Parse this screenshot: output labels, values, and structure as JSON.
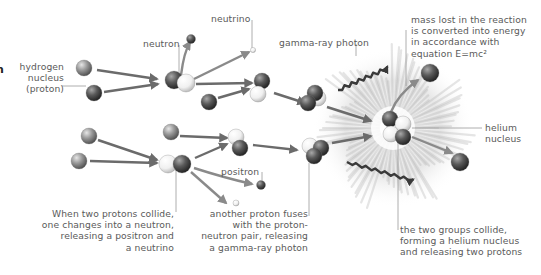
{
  "diagram": {
    "title_fragment": "n",
    "labels": {
      "hydrogen_nucleus": "hydrogen\nnucleus\n(proton)",
      "neutron": "neutron",
      "neutrino": "neutrino",
      "gamma_ray_photon": "gamma-ray photon",
      "mass_lost": "mass lost in the reaction\nis converted into energy\nin accordance with\nequation E=mc²",
      "helium_nucleus": "helium\nnucleus",
      "positron": "positron",
      "step1": "When two protons collide,\none changes into a neutron,\nreleasing a positron and\na neutrino",
      "step2": "another proton fuses\nwith the proton-\nneutron pair, releasing\na gamma-ray photon",
      "step3": "the two groups collide,\nforming a helium nucleus\nand releasing two protons"
    },
    "particle_types": {
      "proton": {
        "name": "proton",
        "color": "#8a8a8a"
      },
      "neutron": {
        "name": "neutron",
        "color": "#555555"
      },
      "light": {
        "name": "proton (light)",
        "color": "#f2f2f2"
      },
      "neutrino": {
        "name": "neutrino",
        "color": "#e8e8e8"
      },
      "positron": {
        "name": "positron",
        "color": "#5a5a5a"
      }
    },
    "colors": {
      "arrow": "#6b6b6b",
      "leader_line": "#9a9a9a",
      "text": "#5a5a5a",
      "burst": "#b0b0b0"
    }
  }
}
